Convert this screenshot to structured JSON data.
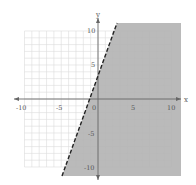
{
  "chart_data": {
    "type": "inequality-region",
    "title": "",
    "xlabel": "x",
    "ylabel": "y",
    "xlim": [
      -10,
      10
    ],
    "ylim": [
      -10,
      10
    ],
    "grid": true,
    "x_ticks": [
      "-10",
      "-5",
      "0",
      "5",
      "10"
    ],
    "y_ticks": [
      "10",
      "5",
      "-5",
      "-10"
    ],
    "boundary_line": {
      "equation": "y = 3x + 4",
      "slope": 3,
      "intercept": 4,
      "style": "dashed"
    },
    "shaded_region": {
      "inequality": "y < 3x + 4",
      "side": "right/below"
    },
    "colors": {
      "shade": "#b3b3b3",
      "grid": "#d6d6d6",
      "axis": "#666666",
      "line": "#222222"
    }
  },
  "labels": {
    "x_axis": "x",
    "y_axis": "y",
    "x_neg10": "-10",
    "x_neg5": "-5",
    "origin": "0",
    "x_5": "5",
    "x_10": "10",
    "y_10": "10",
    "y_5": "5",
    "y_neg5": "-5",
    "y_neg10": "-10"
  }
}
